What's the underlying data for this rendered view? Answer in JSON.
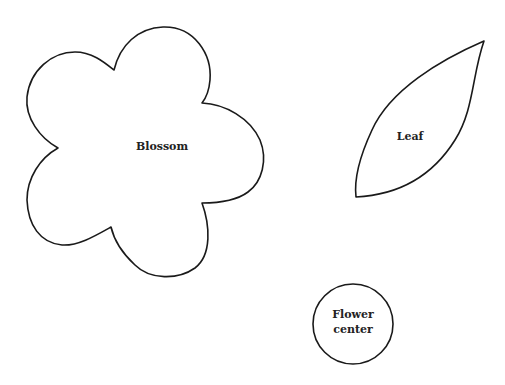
{
  "shapes": {
    "blossom": {
      "label": "Blossom"
    },
    "leaf": {
      "label": "Leaf"
    },
    "center": {
      "label_line1": "Flower",
      "label_line2": "center"
    }
  },
  "colors": {
    "stroke": "#1a1a1a",
    "fill": "#ffffff",
    "text": "#222222"
  }
}
